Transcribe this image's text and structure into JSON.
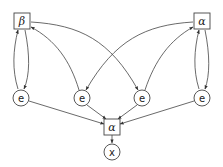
{
  "diagram": {
    "nodes": [
      {
        "id": "beta",
        "label": "β",
        "shape": "square",
        "x": 22,
        "y": 21
      },
      {
        "id": "alpha_top",
        "label": "α",
        "shape": "square",
        "x": 202,
        "y": 21
      },
      {
        "id": "e1",
        "label": "e",
        "shape": "circle",
        "x": 21,
        "y": 98
      },
      {
        "id": "e2",
        "label": "e",
        "shape": "circle",
        "x": 82,
        "y": 98
      },
      {
        "id": "e3",
        "label": "e",
        "shape": "circle",
        "x": 142,
        "y": 98
      },
      {
        "id": "e4",
        "label": "e",
        "shape": "circle",
        "x": 202,
        "y": 98
      },
      {
        "id": "alpha_bottom",
        "label": "α",
        "shape": "square",
        "x": 112,
        "y": 127
      },
      {
        "id": "x",
        "label": "x",
        "shape": "circle",
        "x": 112,
        "y": 152
      }
    ],
    "edges": [
      {
        "from": "beta",
        "to": "e1"
      },
      {
        "from": "e1",
        "to": "beta"
      },
      {
        "from": "alpha_top",
        "to": "e4"
      },
      {
        "from": "e4",
        "to": "alpha_top"
      },
      {
        "from": "beta",
        "to": "e3"
      },
      {
        "from": "e2",
        "to": "beta"
      },
      {
        "from": "alpha_top",
        "to": "e2"
      },
      {
        "from": "e3",
        "to": "alpha_top"
      },
      {
        "from": "e1",
        "to": "alpha_bottom"
      },
      {
        "from": "e2",
        "to": "alpha_bottom"
      },
      {
        "from": "e3",
        "to": "alpha_bottom"
      },
      {
        "from": "e4",
        "to": "alpha_bottom"
      },
      {
        "from": "alpha_bottom",
        "to": "x"
      }
    ],
    "colors": {
      "stroke": "#333333",
      "background": "#ffffff"
    }
  }
}
